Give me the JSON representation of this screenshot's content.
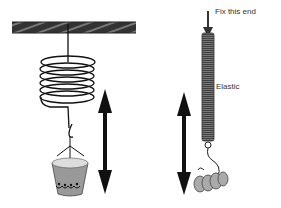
{
  "diagram": {
    "left": {
      "name": "coiled spring with bucket",
      "arrow": "double-headed vertical arrow"
    },
    "right": {
      "name": "elastic with weights",
      "labels": {
        "fix_end": "Fix this end",
        "elastic": "Elastic"
      },
      "arrow": "double-headed vertical arrow"
    }
  }
}
